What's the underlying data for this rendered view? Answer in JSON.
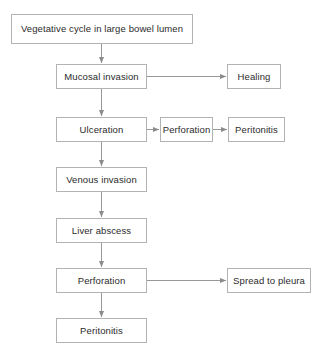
{
  "diagram": {
    "background_color": "#ffffff",
    "box_border_color": "#b3b3b3",
    "edge_color": "#8c8c8c",
    "text_color": "#2b2b2b",
    "nodes": [
      {
        "id": "vegetative",
        "label": "Vegetative cycle in large bowel lumen",
        "x": 11,
        "y": 14,
        "w": 182,
        "h": 30
      },
      {
        "id": "mucosal",
        "label": "Mucosal invasion",
        "x": 56,
        "y": 64,
        "w": 91,
        "h": 25
      },
      {
        "id": "healing",
        "label": "Healing",
        "x": 227,
        "y": 64,
        "w": 54,
        "h": 25
      },
      {
        "id": "ulceration",
        "label": "Ulceration",
        "x": 56,
        "y": 117,
        "w": 91,
        "h": 25
      },
      {
        "id": "perforation-upper",
        "label": "Perforation",
        "x": 160,
        "y": 117,
        "w": 53,
        "h": 25
      },
      {
        "id": "peritonitis-upper",
        "label": "Peritonitis",
        "x": 228,
        "y": 117,
        "w": 57,
        "h": 25
      },
      {
        "id": "venous",
        "label": "Venous invasion",
        "x": 56,
        "y": 167,
        "w": 91,
        "h": 25
      },
      {
        "id": "liver-abscess",
        "label": "Liver abscess",
        "x": 56,
        "y": 218,
        "w": 91,
        "h": 25
      },
      {
        "id": "perforation-lower",
        "label": "Perforation",
        "x": 56,
        "y": 268,
        "w": 91,
        "h": 25
      },
      {
        "id": "spread-pleura",
        "label": "Spread to pleura",
        "x": 227,
        "y": 268,
        "w": 84,
        "h": 25
      },
      {
        "id": "peritonitis-lower",
        "label": "Peritonitis",
        "x": 56,
        "y": 318,
        "w": 91,
        "h": 25
      }
    ],
    "edges": [
      {
        "id": "vegetative-to-mucosal",
        "from": "vegetative",
        "to": "mucosal",
        "direction": "vertical"
      },
      {
        "id": "mucosal-to-healing",
        "from": "mucosal",
        "to": "healing",
        "direction": "horizontal"
      },
      {
        "id": "mucosal-to-ulceration",
        "from": "mucosal",
        "to": "ulceration",
        "direction": "vertical"
      },
      {
        "id": "ulceration-to-perforation",
        "from": "ulceration",
        "to": "perforation-upper",
        "direction": "horizontal"
      },
      {
        "id": "perforation-to-peritonitis",
        "from": "perforation-upper",
        "to": "peritonitis-upper",
        "direction": "horizontal"
      },
      {
        "id": "ulceration-to-venous",
        "from": "ulceration",
        "to": "venous",
        "direction": "vertical"
      },
      {
        "id": "venous-to-liver",
        "from": "venous",
        "to": "liver-abscess",
        "direction": "vertical"
      },
      {
        "id": "liver-to-perforation",
        "from": "liver-abscess",
        "to": "perforation-lower",
        "direction": "vertical"
      },
      {
        "id": "perforation-to-pleura",
        "from": "perforation-lower",
        "to": "spread-pleura",
        "direction": "horizontal"
      },
      {
        "id": "perforation-to-peritonitis-lower",
        "from": "perforation-lower",
        "to": "peritonitis-lower",
        "direction": "vertical"
      }
    ]
  }
}
